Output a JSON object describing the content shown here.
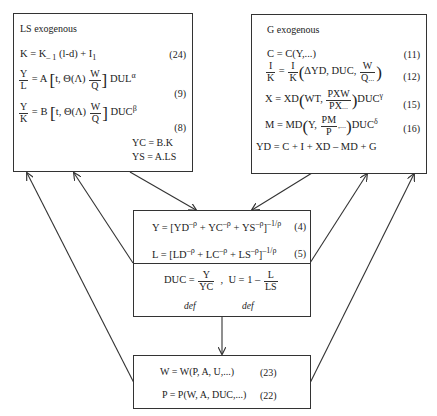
{
  "ls_box": {
    "title": "LS exogenous",
    "eq24": {
      "lhs": "K = K",
      "sub1": "– 1",
      "mid": "(l-d) + I",
      "sub2": "1",
      "num": "(24)"
    },
    "eq9": {
      "frac_n": "Y",
      "frac_d": "L",
      "pre": "= A",
      "inner": "t, Θ(Λ)",
      "wq_n": "W",
      "wq_d": "Q",
      "post": "DUL",
      "sup": "α",
      "num": "(9)"
    },
    "eq8": {
      "frac_n": "Y",
      "frac_d": "K",
      "pre": "= B",
      "inner": "t, Θ(Λ)",
      "wq_n": "W",
      "wq_d": "Q",
      "post": "DUC",
      "sup": "β",
      "num": "(8)"
    },
    "yc": "YC = B.K",
    "ys": "YS = A.LS"
  },
  "g_box": {
    "title": "G exogenous",
    "eq11": {
      "text": "C = C(Y,...)",
      "num": "(11)"
    },
    "eq12": {
      "l_n": "I",
      "l_d": "K",
      "eq": "=",
      "r_n": "I",
      "r_d": "K",
      "args": "ΔYD, DUC,",
      "w_n": "W",
      "w_d": "Q",
      "w_suf": "...",
      "num": "(12)"
    },
    "eq15": {
      "pre": "X = XD",
      "args": "WT,",
      "f_n": "PXW",
      "f_d": "PX",
      "f_suf": "...",
      "post": "DUC",
      "sup": "γ",
      "num": "(15)"
    },
    "eq16": {
      "pre": "M = MD",
      "args": "Y,",
      "f_n": "PM",
      "f_d": "P",
      "f_suf": ",...",
      "post": "DUC",
      "sup": "δ",
      "num": "(16)"
    },
    "yd": "YD = C + I + XD – MD + G"
  },
  "ces_box": {
    "eq4": {
      "text": "Y = [YD",
      "e1": "–ρ",
      "t2": " + YC",
      "e2": "–ρ",
      "t3": " + YS",
      "e3": "–ρ",
      "t4": "]",
      "exp": "–1/ρ",
      "num": "(4)"
    },
    "eq5": {
      "text": "L = [LD",
      "e1": "–ρ",
      "t2": " + LC",
      "e2": "–ρ",
      "t3": " + LS",
      "e3": "–ρ",
      "t4": "]",
      "exp": "–1/ρ",
      "num": "(5)"
    }
  },
  "def_box": {
    "duc_lhs": "DUC =",
    "duc_n": "Y",
    "duc_d": "YC",
    "sep": ",",
    "u_lhs": "U = 1 –",
    "u_n": "L",
    "u_d": "LS",
    "def1": "def",
    "def2": "def"
  },
  "wp_box": {
    "eq23": {
      "text": "W = W(P, A, U,...)",
      "num": "(23)"
    },
    "eq22": {
      "text": "P = P(W, A, DUC,...)",
      "num": "(22)"
    }
  },
  "colors": {
    "line": "#333333",
    "background": "#ffffff"
  }
}
